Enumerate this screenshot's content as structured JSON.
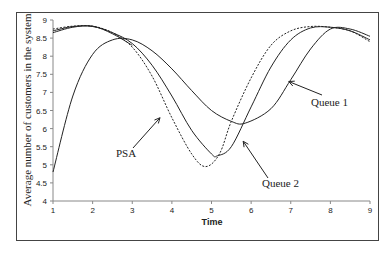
{
  "chart_data": {
    "type": "line",
    "title": "",
    "xlabel": "Time",
    "ylabel": "Average number of customers in the system",
    "xlim": [
      1,
      9
    ],
    "ylim": [
      4,
      9
    ],
    "xticks": [
      "1",
      "2",
      "3",
      "4",
      "5",
      "6",
      "7",
      "8",
      "9"
    ],
    "yticks": [
      "4",
      "4.5",
      "5",
      "5.5",
      "6",
      "6.5",
      "7",
      "7.5",
      "8",
      "8.5",
      "9"
    ],
    "grid": false,
    "legend": "none (annotated with arrows)",
    "series": [
      {
        "name": "Queue 1",
        "style": "solid",
        "x": [
          1,
          1.5,
          2,
          2.5,
          3,
          3.5,
          4,
          4.5,
          5,
          5.5,
          5.85,
          6.5,
          7,
          7.5,
          8,
          8.5,
          9
        ],
        "y": [
          4.8,
          6.9,
          8.05,
          8.45,
          8.45,
          8.15,
          7.65,
          7.05,
          6.5,
          6.2,
          6.15,
          6.55,
          7.35,
          8.2,
          8.75,
          8.75,
          8.55
        ]
      },
      {
        "name": "Queue 2",
        "style": "solid",
        "x": [
          1,
          1.5,
          2,
          2.5,
          3,
          3.5,
          4,
          4.5,
          5,
          5.15,
          5.5,
          6,
          6.5,
          7,
          7.5,
          8,
          8.5,
          9
        ],
        "y": [
          8.7,
          8.82,
          8.82,
          8.65,
          8.35,
          7.75,
          6.9,
          5.95,
          5.3,
          5.25,
          5.5,
          6.6,
          7.7,
          8.45,
          8.78,
          8.8,
          8.7,
          8.45
        ]
      },
      {
        "name": "PSA",
        "style": "dashed",
        "x": [
          1,
          1.5,
          2,
          2.5,
          3,
          3.5,
          4,
          4.5,
          4.85,
          5.2,
          5.5,
          6,
          6.5,
          7,
          7.5,
          8,
          8.5,
          9
        ],
        "y": [
          8.75,
          8.83,
          8.83,
          8.65,
          8.25,
          7.45,
          6.3,
          5.3,
          4.95,
          5.3,
          6.2,
          7.4,
          8.3,
          8.7,
          8.82,
          8.8,
          8.7,
          8.4
        ]
      },
      {
        "name": "(unlabeled)",
        "style": "solid",
        "x": [
          1,
          1.5,
          2,
          2.5,
          3
        ],
        "y": [
          8.65,
          8.8,
          8.83,
          8.62,
          8.3
        ]
      }
    ],
    "annotations": [
      {
        "text": "Queue 1",
        "arrow_to": [
          6.95,
          7.3
        ]
      },
      {
        "text": "Queue 2",
        "arrow_to": [
          5.8,
          5.65
        ]
      },
      {
        "text": "PSA",
        "arrow_to": [
          3.7,
          6.3
        ]
      }
    ]
  },
  "labels": {
    "xlabel": "Time",
    "ylabel": "Average number of customers in the system",
    "queue1": "Queue 1",
    "queue2": "Queue 2",
    "psa": "PSA"
  }
}
